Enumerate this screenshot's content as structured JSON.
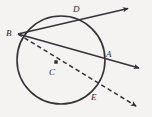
{
  "figure": {
    "kind": "circle-geometry-diagram",
    "background_color": "#f4f3f1",
    "stroke_color": "#33333a",
    "width": 152,
    "height": 117
  },
  "circle": {
    "name": "main-circle",
    "center_x": 61,
    "center_y": 60,
    "radius": 44,
    "stroke_width": 1.6
  },
  "points": [
    {
      "id": "B",
      "label": "B",
      "x": 18,
      "y": 34,
      "label_x": 6,
      "label_y": 29,
      "on_circle": true,
      "marker": false
    },
    {
      "id": "D",
      "label": "D",
      "x": 79,
      "y": 18,
      "label_x": 73,
      "label_y": 5,
      "on_circle": true,
      "marker": false
    },
    {
      "id": "A",
      "label": "A",
      "x": 103,
      "y": 62,
      "label_x": 106,
      "label_y": 50,
      "on_circle": true,
      "marker": false
    },
    {
      "id": "C",
      "label": "C",
      "x": 56,
      "y": 62,
      "label_x": 49,
      "label_y": 68,
      "on_circle": false,
      "marker": true
    },
    {
      "id": "E",
      "label": "E",
      "x": 93,
      "y": 92,
      "label_x": 91,
      "label_y": 93,
      "on_circle": true,
      "marker": false
    }
  ],
  "rays": [
    {
      "id": "ray-BD",
      "from": "B",
      "through": "D",
      "style": "solid",
      "x1": 18,
      "y1": 34,
      "x2": 131,
      "y2": 8,
      "arrowhead": true
    },
    {
      "id": "ray-BA",
      "from": "B",
      "through": "A",
      "style": "solid",
      "x1": 18,
      "y1": 34,
      "x2": 142,
      "y2": 69,
      "arrowhead": true
    },
    {
      "id": "ray-BCE",
      "from": "B",
      "through": "C",
      "style": "dashed",
      "x1": 18,
      "y1": 34,
      "x2": 139,
      "y2": 108,
      "arrowhead": true
    }
  ],
  "labels": {
    "B": "B",
    "D": "D",
    "A": "A",
    "C": "C",
    "E": "E"
  }
}
